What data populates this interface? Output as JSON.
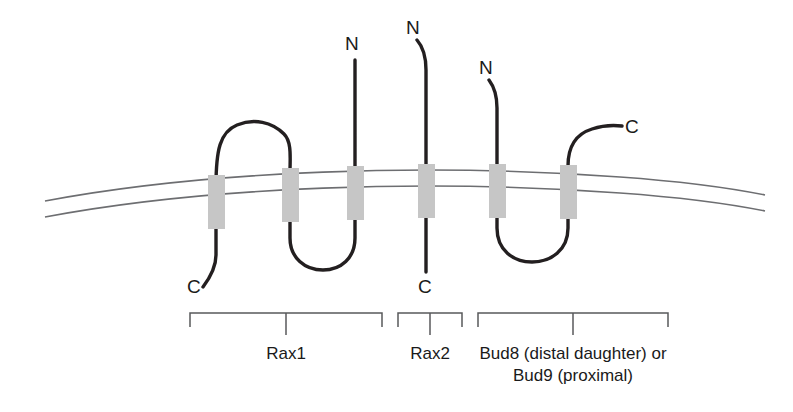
{
  "figure": {
    "type": "membrane-protein-topology-diagram",
    "background_color": "#ffffff",
    "chain_color": "#231f20",
    "membrane_line_color": "#6d6e71",
    "tm_segment_color": "#c6c6c6",
    "bracket_color": "#58595b",
    "text_color": "#1a1a1a"
  },
  "terminus_labels": [
    {
      "id": "rax1-n",
      "text": "N"
    },
    {
      "id": "rax1-c",
      "text": "C"
    },
    {
      "id": "rax2-n",
      "text": "N"
    },
    {
      "id": "rax2-c",
      "text": "C"
    },
    {
      "id": "bud-n",
      "text": "N"
    },
    {
      "id": "bud-c",
      "text": "C"
    }
  ],
  "proteins": [
    {
      "id": "rax1",
      "label": "Rax1",
      "label_lines": [
        "Rax1"
      ],
      "tm_count": 3,
      "n_terminus": "N",
      "c_terminus": "C",
      "n_side": "extracellular",
      "c_side": "cytoplasmic"
    },
    {
      "id": "rax2",
      "label": "Rax2",
      "label_lines": [
        "Rax2"
      ],
      "tm_count": 1,
      "n_terminus": "N",
      "c_terminus": "C",
      "n_side": "extracellular",
      "c_side": "cytoplasmic"
    },
    {
      "id": "bud8-bud9",
      "label": "Bud8 (distal daughter) or Bud9 (proximal)",
      "label_lines": [
        "Bud8 (distal daughter) or",
        "Bud9 (proximal)"
      ],
      "tm_count": 2,
      "n_terminus": "N",
      "c_terminus": "C",
      "n_side": "extracellular",
      "c_side": "extracellular"
    }
  ],
  "membrane": {
    "description": "lipid bilayer drawn as two gently arched parallel lines",
    "line_count": 2
  },
  "transmembrane_segments": {
    "count": 6,
    "description": "light grey rectangles straddling the bilayer"
  }
}
